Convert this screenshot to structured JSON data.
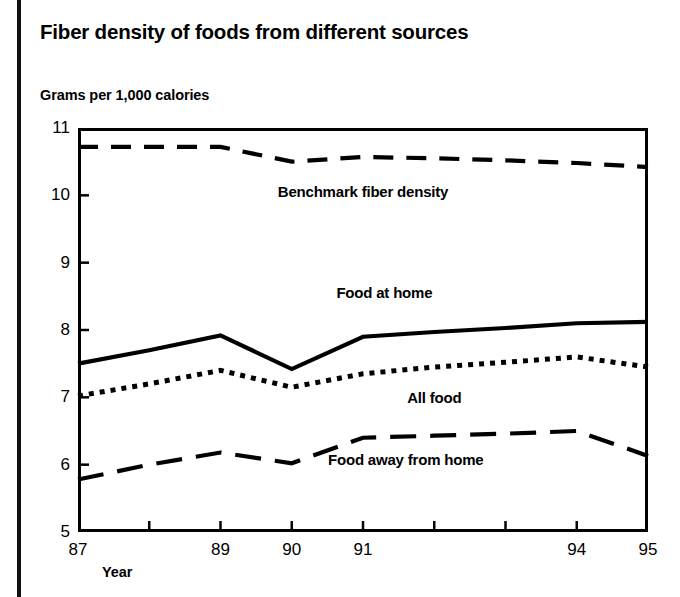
{
  "title": "Fiber density of foods from different sources",
  "y_axis_title": "Grams per 1,000 calories",
  "x_axis_title": "Year",
  "colors": {
    "ink": "#000000",
    "background": "#ffffff"
  },
  "chart_data": {
    "type": "line",
    "title": "Fiber density of foods from different sources",
    "xlabel": "Year",
    "ylabel": "Grams per 1,000 calories",
    "x": [
      87,
      88,
      89,
      90,
      91,
      92,
      93,
      94,
      95
    ],
    "x_tick_labels": [
      "87",
      "",
      "89",
      "90",
      "91",
      "",
      "",
      "94",
      "95"
    ],
    "y_tick_labels": [
      "5",
      "6",
      "7",
      "8",
      "9",
      "10",
      "11"
    ],
    "xlim": [
      87,
      95
    ],
    "ylim": [
      5,
      11
    ],
    "grid": false,
    "legend": "inline-annotations",
    "series": [
      {
        "name": "Benchmark fiber density",
        "style": "dashed",
        "label_x": 91.0,
        "label_y": 10.18,
        "values": [
          10.72,
          10.72,
          10.72,
          10.5,
          10.57,
          10.55,
          10.52,
          10.48,
          10.42
        ]
      },
      {
        "name": "Food at home",
        "style": "solid",
        "label_x": 91.3,
        "label_y": 8.68,
        "values": [
          7.5,
          7.7,
          7.92,
          7.42,
          7.9,
          7.97,
          8.03,
          8.1,
          8.12
        ]
      },
      {
        "name": "All food",
        "style": "dotted",
        "label_x": 92.0,
        "label_y": 7.12,
        "values": [
          7.02,
          7.2,
          7.4,
          7.15,
          7.35,
          7.45,
          7.52,
          7.6,
          7.45
        ]
      },
      {
        "name": "Food away from home",
        "style": "long-dashed",
        "label_x": 91.6,
        "label_y": 6.2,
        "values": [
          5.78,
          6.0,
          6.18,
          6.02,
          6.4,
          6.43,
          6.46,
          6.5,
          6.13
        ]
      }
    ]
  }
}
